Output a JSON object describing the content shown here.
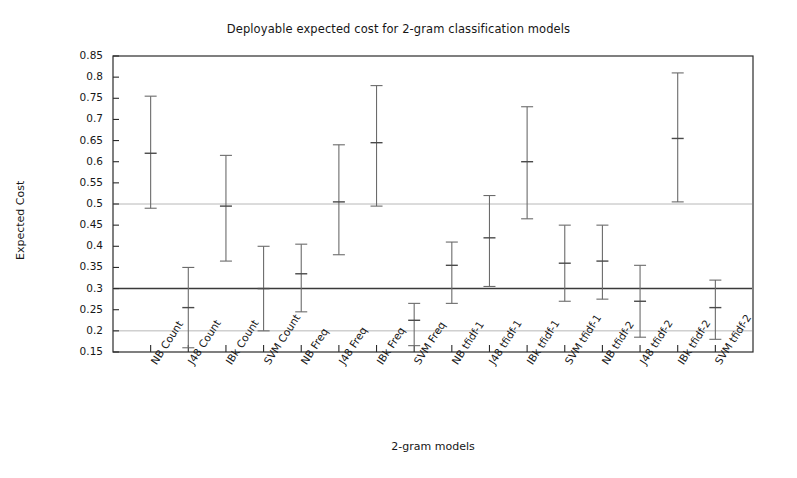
{
  "chart_data": {
    "type": "scatter",
    "title": "Deployable expected cost for 2-gram classification models",
    "xlabel": "2-gram models",
    "ylabel": "Expected Cost",
    "ylim": [
      0.15,
      0.85
    ],
    "ytick_labels": [
      "0.85",
      "0.8",
      "0.75",
      "0.7",
      "0.65",
      "0.6",
      "0.55",
      "0.5",
      "0.45",
      "0.4",
      "0.35",
      "0.3",
      "0.25",
      "0.2",
      "0.15"
    ],
    "ytick_values": [
      0.85,
      0.8,
      0.75,
      0.7,
      0.65,
      0.6,
      0.55,
      0.5,
      0.45,
      0.4,
      0.35,
      0.3,
      0.25,
      0.2,
      0.15
    ],
    "grid": false,
    "legend": "none",
    "reference_lines": [
      {
        "value": 0.5,
        "style": "light"
      },
      {
        "value": 0.3,
        "style": "dark"
      },
      {
        "value": 0.2,
        "style": "light"
      }
    ],
    "categories": [
      "NB Count",
      "J48 Count",
      "IBk Count",
      "SVM Count",
      "NB Freq",
      "J48 Freq",
      "IBk Freq",
      "SVM Freq",
      "NB tfidf-1",
      "J48 tfidf-1",
      "IBk tfidf-1",
      "SVM tfidf-1",
      "NB tfidf-2",
      "J48 tfidf-2",
      "IBk tfidf-2",
      "SVM tfidf-2"
    ],
    "values": [
      0.62,
      0.255,
      0.495,
      0.3,
      0.335,
      0.505,
      0.645,
      0.225,
      0.355,
      0.42,
      0.6,
      0.36,
      0.365,
      0.27,
      0.655,
      0.255
    ],
    "err_low": [
      0.49,
      0.16,
      0.365,
      0.2,
      0.245,
      0.38,
      0.495,
      0.165,
      0.265,
      0.305,
      0.465,
      0.27,
      0.275,
      0.185,
      0.505,
      0.18
    ],
    "err_high": [
      0.755,
      0.35,
      0.615,
      0.4,
      0.405,
      0.64,
      0.78,
      0.265,
      0.41,
      0.52,
      0.73,
      0.45,
      0.45,
      0.355,
      0.81,
      0.32
    ],
    "series": [
      {
        "name": "Expected Cost",
        "points": [
          {
            "category": "NB Count",
            "value": 0.62,
            "low": 0.49,
            "high": 0.755
          },
          {
            "category": "J48 Count",
            "value": 0.255,
            "low": 0.16,
            "high": 0.35
          },
          {
            "category": "IBk Count",
            "value": 0.495,
            "low": 0.365,
            "high": 0.615
          },
          {
            "category": "SVM Count",
            "value": 0.3,
            "low": 0.2,
            "high": 0.4
          },
          {
            "category": "NB Freq",
            "value": 0.335,
            "low": 0.245,
            "high": 0.405
          },
          {
            "category": "J48 Freq",
            "value": 0.505,
            "low": 0.38,
            "high": 0.64
          },
          {
            "category": "IBk Freq",
            "value": 0.645,
            "low": 0.495,
            "high": 0.78
          },
          {
            "category": "SVM Freq",
            "value": 0.225,
            "low": 0.165,
            "high": 0.265
          },
          {
            "category": "NB tfidf-1",
            "value": 0.355,
            "low": 0.265,
            "high": 0.41
          },
          {
            "category": "J48 tfidf-1",
            "value": 0.42,
            "low": 0.305,
            "high": 0.52
          },
          {
            "category": "IBk tfidf-1",
            "value": 0.6,
            "low": 0.465,
            "high": 0.73
          },
          {
            "category": "SVM tfidf-1",
            "value": 0.36,
            "low": 0.27,
            "high": 0.45
          },
          {
            "category": "NB tfidf-2",
            "value": 0.365,
            "low": 0.275,
            "high": 0.45
          },
          {
            "category": "J48 tfidf-2",
            "value": 0.27,
            "low": 0.185,
            "high": 0.355
          },
          {
            "category": "IBk tfidf-2",
            "value": 0.655,
            "low": 0.505,
            "high": 0.81
          },
          {
            "category": "SVM tfidf-2",
            "value": 0.255,
            "low": 0.18,
            "high": 0.32
          }
        ]
      }
    ],
    "colors": {
      "marker": "#4a4a4a",
      "errorbar": "#6b6b6b",
      "axis": "#2b2b2b",
      "reference_light": "#b8b8b8",
      "reference_dark": "#3a3a3a",
      "background": "#ffffff"
    }
  }
}
